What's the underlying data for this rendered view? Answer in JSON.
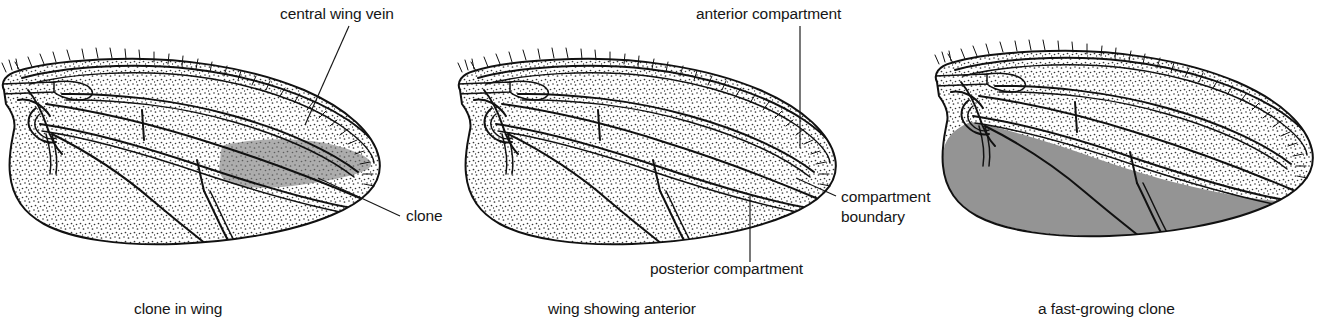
{
  "figure": {
    "background_color": "#ffffff",
    "ink_color": "#111111",
    "blade_fill_color": "#fdfdfd",
    "stipple_color": "#3a3a3a",
    "clone_gray_light": "#a9a9a9",
    "clone_gray_dark": "#949494"
  },
  "panels": [
    {
      "id": "panel-clone-in-wing",
      "caption": "clone in wing",
      "labels": [
        {
          "id": "central-wing-vein",
          "text": "central wing vein"
        },
        {
          "id": "clone",
          "text": "clone"
        }
      ],
      "shaded_regions": [
        {
          "name": "clone-patch",
          "color": "#a9a9a9",
          "description": "small irregular gray clone patch in posterior-central blade"
        }
      ]
    },
    {
      "id": "panel-anterior-posterior",
      "caption": "wing showing anterior",
      "labels": [
        {
          "id": "anterior-compartment",
          "text": "anterior compartment"
        },
        {
          "id": "posterior-compartment",
          "text": "posterior compartment"
        },
        {
          "id": "compartment-boundary-line1",
          "text": "compartment"
        },
        {
          "id": "compartment-boundary-line2",
          "text": "boundary"
        }
      ],
      "shaded_regions": []
    },
    {
      "id": "panel-fast-growing-clone",
      "caption": "a fast-growing clone",
      "labels": [],
      "shaded_regions": [
        {
          "name": "fast-clone-patch",
          "color": "#949494",
          "description": "entire posterior compartment filled solid gray, stopping at compartment boundary"
        }
      ]
    }
  ]
}
